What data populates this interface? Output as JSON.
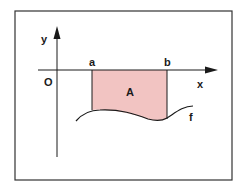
{
  "diagram": {
    "labels": {
      "y_axis": "y",
      "x_axis": "x",
      "origin": "O",
      "a": "a",
      "b": "b",
      "area": "A",
      "function": "f"
    },
    "colors": {
      "area_fill": "#f2c4c2",
      "line": "#1a1a1a",
      "frame": "#333333",
      "background": "#ffffff"
    }
  }
}
